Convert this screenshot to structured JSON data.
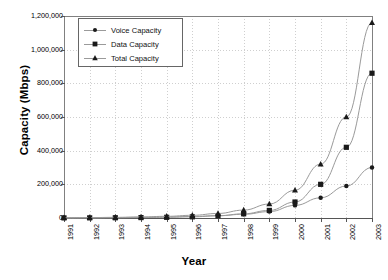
{
  "chart_data": {
    "type": "line",
    "title": "",
    "xlabel": "Year",
    "ylabel": "Capacity (Mbps)",
    "x": [
      1991,
      1992,
      1993,
      1994,
      1995,
      1996,
      1997,
      1998,
      1999,
      2000,
      2001,
      2002,
      2003
    ],
    "categories": [
      "1991",
      "1992",
      "1993",
      "1994",
      "1995",
      "1996",
      "1997",
      "1998",
      "1999",
      "2000",
      "2001",
      "2002",
      "2003"
    ],
    "series": [
      {
        "name": "Voice Capacity",
        "marker": "circle",
        "color": "#1a1a1a",
        "values": [
          1000,
          1500,
          2500,
          4000,
          6000,
          9000,
          14000,
          22000,
          38000,
          75000,
          120000,
          190000,
          300000
        ]
      },
      {
        "name": "Data Capacity",
        "marker": "square",
        "color": "#1a1a1a",
        "values": [
          500,
          800,
          1400,
          2400,
          4000,
          7000,
          13000,
          25000,
          45000,
          95000,
          200000,
          420000,
          860000
        ]
      },
      {
        "name": "Total Capacity",
        "marker": "triangle",
        "color": "#1a1a1a",
        "values": [
          1500,
          2300,
          3900,
          6400,
          10000,
          16000,
          27000,
          47000,
          83000,
          165000,
          320000,
          600000,
          1160000
        ]
      }
    ],
    "ylim": [
      0,
      1200000
    ],
    "yticks": [
      0,
      200000,
      400000,
      600000,
      800000,
      1000000,
      1200000
    ],
    "ytick_labels": [
      "0",
      "200,000",
      "400,000",
      "600,000",
      "800,000",
      "1,000,000",
      "1,200,000"
    ],
    "grid": true,
    "grid_style": "dotted",
    "grid_color": "#cfcfcf",
    "legend_position": "top-left-inside",
    "legend_entries": [
      "Voice Capacity",
      "Data Capacity",
      "Total Capacity"
    ],
    "axis_color": "#808080",
    "plot_border": true,
    "xtick_rotation": 90
  }
}
